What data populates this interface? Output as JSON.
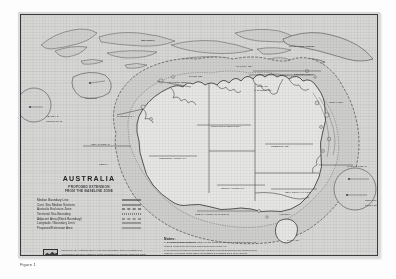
{
  "page": {
    "figure_caption": "Figure 1"
  },
  "title_block": {
    "title": "AUSTRALIA",
    "subtitle_line1": "PROPOSED EXTENSION",
    "subtitle_line2": "FROM THE BASELINE ZONE"
  },
  "legend": {
    "items": [
      {
        "label": "Median Boundary Line",
        "style": "sw-solid"
      },
      {
        "label": "Cont. Sea Median Sections",
        "style": "sw-solid2"
      },
      {
        "label": "Australia Exclusive Zone",
        "style": "sw-dash"
      },
      {
        "label": "Territorial Sea Boundary",
        "style": "sw-dot"
      },
      {
        "label": "Adjacent Area (Block Boundary)",
        "style": "sw-dashdot"
      },
      {
        "label": "Longitude / Boundary Limit",
        "style": "sw-thin"
      },
      {
        "label": "Proposed Extension Area",
        "style": "sw-band"
      }
    ]
  },
  "notes": {
    "title": "Notes:",
    "lines": [
      "1. Baseline as per 1958 Convention on the Territorial Sea and Contiguous Zone, as",
      "    defined pursuant to the Seas and Submerged Lands Act.",
      "2. Proposed extension measured 200 nautical miles seaward from the territorial sea",
      "    baseline, excluding areas where delimitation boundaries have been agreed.",
      "3. The boundaries shown are indicative only and are subject to adjustment following",
      "    negotiation. Approximate positions only, not to be used for navigation purposes."
    ]
  },
  "credit": {
    "logo_name": "agency-logo",
    "lines": [
      "Produced by the Australian Survey and Land Information Group, Department of",
      "Administrative Services, Canberra, for the Department of Foreign Affairs and Trade.",
      "Scale 1:20 000 000 approx.  © Commonwealth of Australia."
    ]
  },
  "map_labels": [
    {
      "text": "INDONESIA",
      "x": 120,
      "y": 24,
      "bold": true
    },
    {
      "text": "PAPUA NEW GUINEA",
      "x": 268,
      "y": 30,
      "bold": true
    },
    {
      "text": "TIMOR SEA",
      "x": 168,
      "y": 60,
      "bold": false
    },
    {
      "text": "ARAFURA SEA",
      "x": 214,
      "y": 50,
      "bold": false
    },
    {
      "text": "CORAL SEA",
      "x": 308,
      "y": 86,
      "bold": false
    },
    {
      "text": "GULF OF",
      "x": 236,
      "y": 70,
      "bold": false
    },
    {
      "text": "CARPENTARIA",
      "x": 233,
      "y": 74,
      "bold": false
    },
    {
      "text": "TORRES STRAIT",
      "x": 273,
      "y": 58,
      "bold": false
    },
    {
      "text": "INDIAN OCEAN",
      "x": 70,
      "y": 128,
      "bold": false
    },
    {
      "text": "WESTERN AUSTRALIA",
      "x": 138,
      "y": 142,
      "bold": false
    },
    {
      "text": "NORTHERN TERRITORY",
      "x": 190,
      "y": 110,
      "bold": false
    },
    {
      "text": "QUEENSLAND",
      "x": 250,
      "y": 130,
      "bold": false
    },
    {
      "text": "SOUTH AUSTRALIA",
      "x": 200,
      "y": 172,
      "bold": false
    },
    {
      "text": "NEW SOUTH WALES",
      "x": 264,
      "y": 176,
      "bold": false
    },
    {
      "text": "VICTORIA",
      "x": 258,
      "y": 198,
      "bold": false
    },
    {
      "text": "TASMANIA",
      "x": 266,
      "y": 224,
      "bold": false
    },
    {
      "text": "GREAT AUSTRALIAN BIGHT",
      "x": 174,
      "y": 198,
      "bold": false
    },
    {
      "text": "SOUTHERN OCEAN",
      "x": 150,
      "y": 226,
      "bold": false
    },
    {
      "text": "PACIFIC OCEAN",
      "x": 326,
      "y": 150,
      "bold": false
    },
    {
      "text": "ASHMORE REEF",
      "x": 146,
      "y": 66,
      "bold": false
    },
    {
      "text": "CHRISTMAS I.",
      "x": 96,
      "y": 100,
      "bold": false
    },
    {
      "text": "PERTH",
      "x": 78,
      "y": 148,
      "bold": false
    }
  ],
  "insets": [
    {
      "name": "heard-mcdonald-inset",
      "label": "HEARD I. &",
      "label2": "McDONALD IS.",
      "cx": 33,
      "cy": 104,
      "r": 17
    },
    {
      "name": "cocos-inset",
      "label": "COCOS IS.",
      "label2": "",
      "cx": 72,
      "cy": 86,
      "r": 20
    },
    {
      "name": "norfolk-inset",
      "label": "NORFOLK I.",
      "label2": "LORD HOWE I.",
      "cx": 352,
      "cy": 188,
      "r": 21
    }
  ]
}
